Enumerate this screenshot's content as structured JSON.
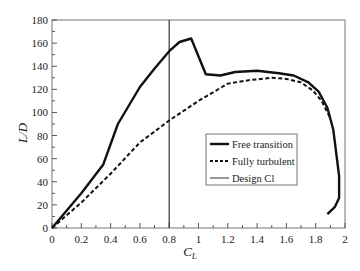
{
  "chart_data": {
    "type": "line",
    "title": "",
    "xlabel": "C_L",
    "ylabel": "L/D",
    "xlim": [
      0,
      2
    ],
    "ylim": [
      0,
      180
    ],
    "xticks": [
      "0",
      "0.2",
      "0.4",
      "0.6",
      "0.8",
      "1",
      "1.2",
      "1.4",
      "1.6",
      "1.8",
      "2"
    ],
    "yticks": [
      "0",
      "20",
      "40",
      "60",
      "80",
      "100",
      "120",
      "140",
      "160",
      "180"
    ],
    "grid": false,
    "legend_position": "lower right (inside)",
    "series": [
      {
        "name": "Free transition",
        "style": "solid-thick",
        "points": [
          [
            0,
            0
          ],
          [
            0.2,
            30
          ],
          [
            0.35,
            55
          ],
          [
            0.45,
            90
          ],
          [
            0.6,
            122
          ],
          [
            0.7,
            138
          ],
          [
            0.8,
            153
          ],
          [
            0.87,
            161
          ],
          [
            0.95,
            164
          ],
          [
            1.05,
            133
          ],
          [
            1.15,
            132
          ],
          [
            1.25,
            135
          ],
          [
            1.4,
            136
          ],
          [
            1.55,
            134
          ],
          [
            1.65,
            132
          ],
          [
            1.75,
            126
          ],
          [
            1.82,
            118
          ],
          [
            1.88,
            104
          ],
          [
            1.92,
            85
          ],
          [
            1.94,
            65
          ],
          [
            1.96,
            45
          ],
          [
            1.96,
            26
          ],
          [
            1.93,
            18
          ],
          [
            1.88,
            12
          ]
        ]
      },
      {
        "name": "Fully turbulent",
        "style": "dashed-thick",
        "points": [
          [
            0,
            0
          ],
          [
            0.2,
            22
          ],
          [
            0.4,
            47
          ],
          [
            0.6,
            74
          ],
          [
            0.8,
            93
          ],
          [
            1.0,
            110
          ],
          [
            1.2,
            125
          ],
          [
            1.35,
            128
          ],
          [
            1.5,
            130
          ],
          [
            1.6,
            129
          ],
          [
            1.7,
            126
          ],
          [
            1.78,
            119
          ],
          [
            1.84,
            110
          ],
          [
            1.9,
            95
          ]
        ]
      },
      {
        "name": "Design Cl",
        "style": "solid-thin-vertical",
        "x": 0.8
      }
    ]
  },
  "legend": {
    "items": [
      {
        "label": "Free transition"
      },
      {
        "label": "Fully turbulent"
      },
      {
        "label": "Design Cl"
      }
    ]
  },
  "axes": {
    "x_title_main": "C",
    "x_title_sub": "L",
    "y_title": "L/D"
  }
}
